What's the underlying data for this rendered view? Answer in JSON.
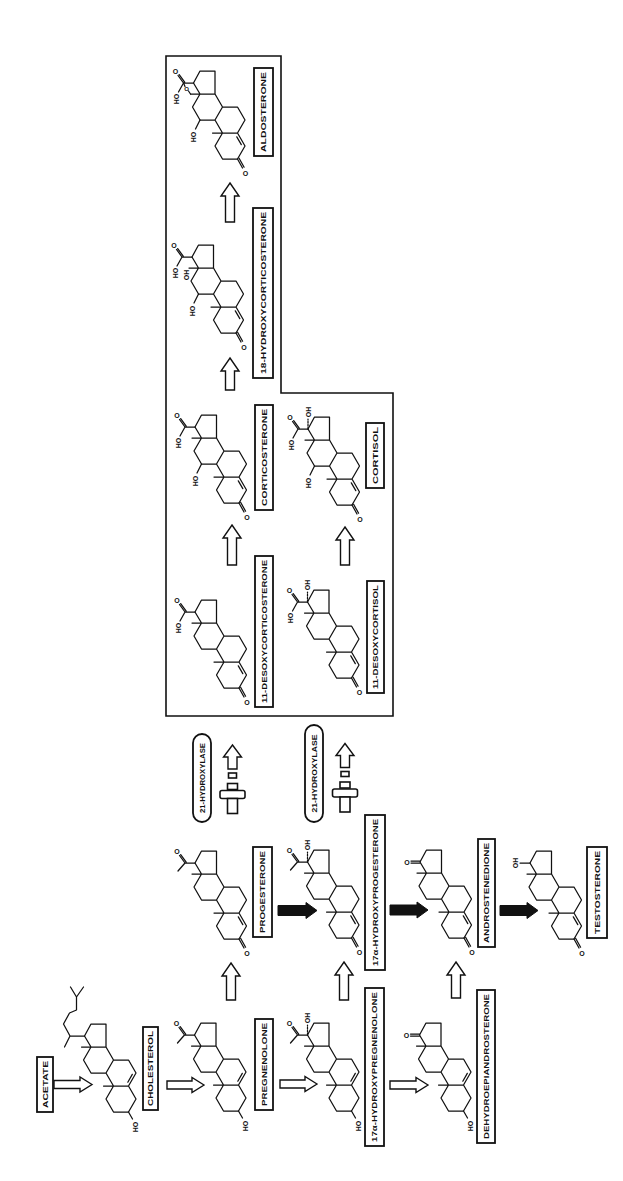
{
  "compounds": {
    "acetate": {
      "name": "ACETATE"
    },
    "cholesterol": {
      "name": "CHOLESTEROL"
    },
    "pregnenolone": {
      "name": "PREGNENOLONE"
    },
    "hydroxypregnenolone_17a": {
      "name": "17α-HYDROXYPREGNENOLONE"
    },
    "dehydroepiandrosterone": {
      "name": "DEHYDROEPIANDROSTERONE"
    },
    "progesterone": {
      "name": "PROGESTERONE"
    },
    "hydroxyprogesterone_17a": {
      "name": "17α-HYDROXYPROGESTERONE"
    },
    "androstenedione": {
      "name": "ANDROSTENEDIONE"
    },
    "testosterone": {
      "name": "TESTOSTERONE"
    },
    "desoxycorticosterone_11": {
      "name": "11-DESOXYCORTICOSTERONE"
    },
    "desoxycortisol_11": {
      "name": "11-DESOXYCORTISOL"
    },
    "corticosterone": {
      "name": "CORTICOSTERONE"
    },
    "cortisol": {
      "name": "CORTISOL"
    },
    "hydroxycorticosterone_18": {
      "name": "18-HYDROXYCORTICOSTERONE"
    },
    "aldosterone": {
      "name": "ALDOSTERONE"
    }
  },
  "enzymes": [
    {
      "name": "21-HYDROXYLASE",
      "from": "PROGESTERONE",
      "to": "11-DESOXYCORTICOSTERONE",
      "state": "blocked"
    },
    {
      "name": "21-HYDROXYLASE",
      "from": "17α-HYDROXYPROGESTERONE",
      "to": "11-DESOXYCORTISOL",
      "state": "blocked"
    }
  ],
  "atoms": {
    "O": "O",
    "HO": "HO",
    "OH": "OH"
  },
  "boxed_group": [
    "11-DESOXYCORTICOSTERONE",
    "CORTICOSTERONE",
    "18-HYDROXYCORTICOSTERONE",
    "ALDOSTERONE",
    "11-DESOXYCORTISOL",
    "CORTISOL"
  ],
  "pathways": [
    {
      "from": "ACETATE",
      "to": "CHOLESTEROL",
      "arrow": "open"
    },
    {
      "from": "CHOLESTEROL",
      "to": "PREGNENOLONE",
      "arrow": "open"
    },
    {
      "from": "PREGNENOLONE",
      "to": "17α-HYDROXYPREGNENOLONE",
      "arrow": "open"
    },
    {
      "from": "17α-HYDROXYPREGNENOLONE",
      "to": "DEHYDROEPIANDROSTERONE",
      "arrow": "open"
    },
    {
      "from": "PREGNENOLONE",
      "to": "PROGESTERONE",
      "arrow": "open"
    },
    {
      "from": "17α-HYDROXYPREGNENOLONE",
      "to": "17α-HYDROXYPROGESTERONE",
      "arrow": "open"
    },
    {
      "from": "DEHYDROEPIANDROSTERONE",
      "to": "ANDROSTENEDIONE",
      "arrow": "open"
    },
    {
      "from": "PROGESTERONE",
      "to": "17α-HYDROXYPROGESTERONE",
      "arrow": "filled"
    },
    {
      "from": "17α-HYDROXYPROGESTERONE",
      "to": "ANDROSTENEDIONE",
      "arrow": "filled"
    },
    {
      "from": "ANDROSTENEDIONE",
      "to": "TESTOSTERONE",
      "arrow": "filled"
    },
    {
      "from": "PROGESTERONE",
      "to": "11-DESOXYCORTICOSTERONE",
      "arrow": "blocked",
      "enzyme": "21-HYDROXYLASE"
    },
    {
      "from": "17α-HYDROXYPROGESTERONE",
      "to": "11-DESOXYCORTISOL",
      "arrow": "blocked",
      "enzyme": "21-HYDROXYLASE"
    },
    {
      "from": "11-DESOXYCORTICOSTERONE",
      "to": "CORTICOSTERONE",
      "arrow": "open"
    },
    {
      "from": "11-DESOXYCORTISOL",
      "to": "CORTISOL",
      "arrow": "open"
    },
    {
      "from": "CORTICOSTERONE",
      "to": "18-HYDROXYCORTICOSTERONE",
      "arrow": "open"
    },
    {
      "from": "18-HYDROXYCORTICOSTERONE",
      "to": "ALDOSTERONE",
      "arrow": "open"
    }
  ],
  "colors": {
    "ink": "#111111",
    "background": "#ffffff"
  }
}
